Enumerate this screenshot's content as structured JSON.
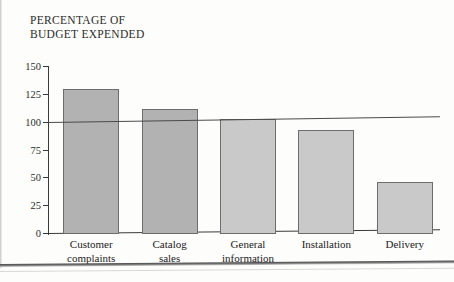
{
  "chart_data": {
    "type": "bar",
    "title": "PERCENTAGE OF\nBUDGET EXPENDED",
    "xlabel": "",
    "ylabel": "",
    "categories": [
      "Customer\ncomplaints",
      "Catalog\nsales",
      "General\ninformation",
      "Installation",
      "Delivery"
    ],
    "values": [
      130,
      112,
      103,
      93,
      47
    ],
    "ylim": [
      0,
      150
    ],
    "yticks": [
      0,
      25,
      50,
      75,
      100,
      125,
      150
    ],
    "ytick_labels": [
      "0",
      "25",
      "50",
      "75",
      "100",
      "125",
      "150"
    ],
    "grid": false,
    "legend": null,
    "annotations": [
      {
        "name": "budget-reference-line",
        "type": "hline",
        "value": 100
      }
    ],
    "bar_colors": [
      "#b2b2b2",
      "#b2b2b2",
      "#c9c9c9",
      "#c9c9c9",
      "#c9c9c9"
    ],
    "bar_edge_color": "#6d6d6d",
    "axis_color": "#3a3a3a",
    "reference_line_color": "#4a4a4a"
  }
}
